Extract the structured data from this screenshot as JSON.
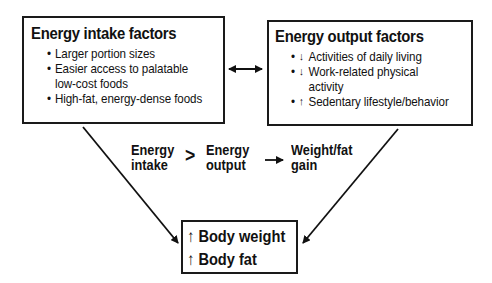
{
  "intake_box": {
    "title": "Energy intake factors",
    "items": [
      "Larger portion sizes",
      "Easier access to palatable",
      "low-cost foods",
      "High-fat, energy-dense foods"
    ]
  },
  "output_box": {
    "title": "Energy output factors",
    "items": [
      {
        "arrow": "down-arrow-icon",
        "glyph": "↓",
        "text": "Activities of daily living"
      },
      {
        "arrow": "down-arrow-icon",
        "glyph": "↓",
        "text": "Work-related physical"
      },
      {
        "arrow": "",
        "glyph": "",
        "text": "activity"
      },
      {
        "arrow": "up-arrow-icon",
        "glyph": "↑",
        "text": "Sedentary lifestyle/behavior"
      }
    ]
  },
  "equation": {
    "left_line1": "Energy",
    "left_line2": "intake",
    "operator": ">",
    "right_line1": "Energy",
    "right_line2": "output",
    "result_arrow": "→",
    "result_line1": "Weight/fat",
    "result_line2": "gain"
  },
  "result_box": {
    "up_glyph": "↑",
    "line1": "Body weight",
    "line2": "Body fat"
  },
  "connector_between_boxes": "↔"
}
